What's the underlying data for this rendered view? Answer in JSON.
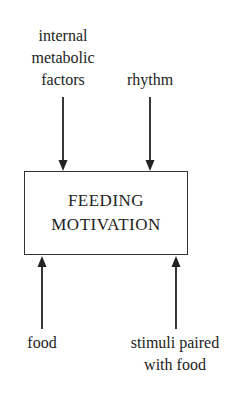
{
  "diagram": {
    "center_box": {
      "line1": "FEEDING",
      "line2": "MOTIVATION"
    },
    "inputs_top": [
      {
        "lines": [
          "internal",
          "metabolic",
          "factors"
        ]
      },
      {
        "lines": [
          "rhythm"
        ]
      }
    ],
    "inputs_bottom": [
      {
        "lines": [
          "food"
        ]
      },
      {
        "lines": [
          "stimuli paired",
          "with food"
        ]
      }
    ],
    "arrow_color": "#222222"
  }
}
